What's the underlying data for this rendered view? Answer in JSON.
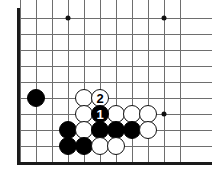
{
  "figure": {
    "board_type": "go-board",
    "background_color": "#ffffff",
    "line_color": "#6e6e6e",
    "edge_color": "#1a1a1a",
    "black_stone_color": "#000000",
    "white_stone_color": "#ffffff",
    "visible_columns": 11,
    "visible_rows": 9,
    "grid_spacing_px": 16,
    "origin_x_px": 20,
    "origin_y_px": 18,
    "stone_radius_px": 9
  },
  "geometry": {
    "columns": [
      0,
      1,
      2,
      3,
      4,
      5,
      6,
      7,
      8,
      9,
      10
    ],
    "rows": [
      0,
      1,
      2,
      3,
      4,
      5,
      6,
      7,
      8
    ],
    "left_edge_x_px": 17,
    "bottom_edge_y_px": 162
  },
  "star_points": [
    {
      "name": "star-point-top-left",
      "col": 3,
      "row": 0
    },
    {
      "name": "star-point-top-right",
      "col": 9,
      "row": 0
    },
    {
      "name": "star-point-right",
      "col": 9,
      "row": 6
    }
  ],
  "stones": [
    {
      "id": "stone-b-c1r5",
      "color": "black",
      "col": 1,
      "row": 5,
      "label": ""
    },
    {
      "id": "stone-w-c4r5",
      "color": "white",
      "col": 4,
      "row": 5,
      "label": ""
    },
    {
      "id": "stone-w-c5r5",
      "color": "white",
      "col": 5,
      "row": 5,
      "label": "2"
    },
    {
      "id": "stone-w-c4r6",
      "color": "white",
      "col": 4,
      "row": 6,
      "label": ""
    },
    {
      "id": "stone-b-c5r6",
      "color": "black",
      "col": 5,
      "row": 6,
      "label": "1"
    },
    {
      "id": "stone-w-c6r6",
      "color": "white",
      "col": 6,
      "row": 6,
      "label": ""
    },
    {
      "id": "stone-w-c7r6",
      "color": "white",
      "col": 7,
      "row": 6,
      "label": ""
    },
    {
      "id": "stone-w-c8r6",
      "color": "white",
      "col": 8,
      "row": 6,
      "label": ""
    },
    {
      "id": "stone-b-c3r7",
      "color": "black",
      "col": 3,
      "row": 7,
      "label": ""
    },
    {
      "id": "stone-w-c4r7",
      "color": "white",
      "col": 4,
      "row": 7,
      "label": ""
    },
    {
      "id": "stone-b-c5r7",
      "color": "black",
      "col": 5,
      "row": 7,
      "label": ""
    },
    {
      "id": "stone-b-c6r7",
      "color": "black",
      "col": 6,
      "row": 7,
      "label": ""
    },
    {
      "id": "stone-b-c7r7",
      "color": "black",
      "col": 7,
      "row": 7,
      "label": ""
    },
    {
      "id": "stone-w-c8r7",
      "color": "white",
      "col": 8,
      "row": 7,
      "label": ""
    },
    {
      "id": "stone-b-c3r8",
      "color": "black",
      "col": 3,
      "row": 8,
      "label": ""
    },
    {
      "id": "stone-b-c4r8",
      "color": "black",
      "col": 4,
      "row": 8,
      "label": ""
    },
    {
      "id": "stone-w-c5r8",
      "color": "white",
      "col": 5,
      "row": 8,
      "label": ""
    },
    {
      "id": "stone-w-c6r8",
      "color": "white",
      "col": 6,
      "row": 8,
      "label": ""
    }
  ],
  "move_markers": [
    {
      "number": "1",
      "color": "black",
      "col": 5,
      "row": 6
    },
    {
      "number": "2",
      "color": "white",
      "col": 5,
      "row": 5
    }
  ]
}
